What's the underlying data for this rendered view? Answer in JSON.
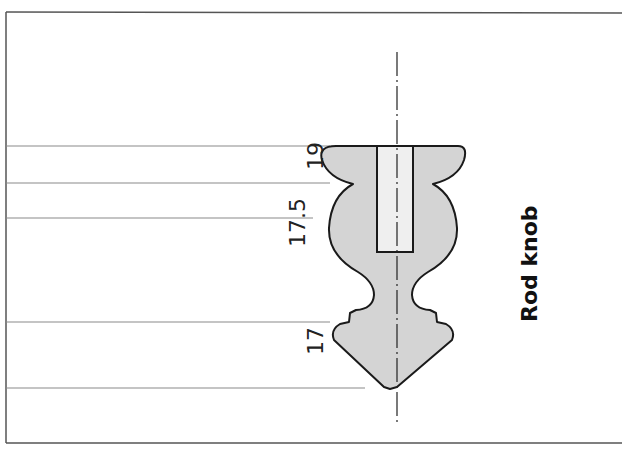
{
  "drawing": {
    "title": "Rod knob",
    "dimensions": [
      {
        "label": "19",
        "value": 19
      },
      {
        "label": "17.5",
        "value": 17.5
      },
      {
        "label": "17",
        "value": 17
      }
    ],
    "colors": {
      "fill": "#d4d4d4",
      "bore_fill": "#efefef",
      "outline": "#1a1a1a",
      "guide_line": "#888888",
      "border": "#555555"
    }
  }
}
